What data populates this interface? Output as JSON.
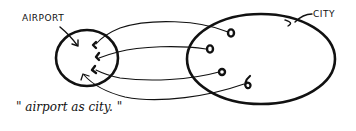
{
  "diagram": {
    "caption": "\" airport as city. \"",
    "nodes": {
      "airport": {
        "label": "AIRPORT",
        "shape": "small-circle"
      },
      "city": {
        "label": "CITY",
        "shape": "large-ellipse"
      }
    },
    "edges": [
      {
        "from": "city.point_1",
        "to": "airport.point_1",
        "style": "curved-arrow"
      },
      {
        "from": "city.point_2",
        "to": "airport.point_2",
        "style": "curved-arrow"
      },
      {
        "from": "city.point_3",
        "to": "airport.point_3",
        "style": "curved-arrow"
      },
      {
        "from": "city.point_4",
        "to": "airport.interior",
        "style": "curved-arrow"
      }
    ],
    "ink_color": "#111111",
    "background": "#ffffff"
  }
}
